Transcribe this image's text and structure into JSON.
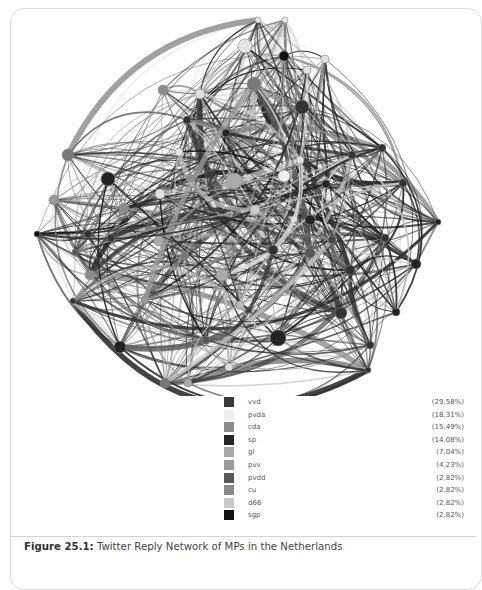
{
  "figure": {
    "label": "Figure 25.1:",
    "title": " Twitter Reply Network of MPs in the Netherlands"
  },
  "legend": [
    {
      "party": "vvd",
      "pct": "(29,58%)",
      "color": "#3a3a3a"
    },
    {
      "party": "pvda",
      "pct": "(18,31%)",
      "color": "#eeeeee"
    },
    {
      "party": "cda",
      "pct": "(15,49%)",
      "color": "#8c8c8c"
    },
    {
      "party": "sp",
      "pct": "(14,08%)",
      "color": "#262626"
    },
    {
      "party": "gl",
      "pct": "(7,04%)",
      "color": "#a8a8a8"
    },
    {
      "party": "pvv",
      "pct": "(4,23%)",
      "color": "#9a9a9a"
    },
    {
      "party": "pvdd",
      "pct": "(2,82%)",
      "color": "#5a5a5a"
    },
    {
      "party": "cu",
      "pct": "(2,82%)",
      "color": "#8a8a8a"
    },
    {
      "party": "d66",
      "pct": "(2,82%)",
      "color": "#c8c8c8"
    },
    {
      "party": "sgp",
      "pct": "(2,82%)",
      "color": "#111111"
    }
  ],
  "network": {
    "nodes": [
      {
        "x": 258,
        "y": 20,
        "r": 3,
        "c": "#e8e8e8"
      },
      {
        "x": 285,
        "y": 20,
        "r": 3,
        "c": "#e8e8e8"
      },
      {
        "x": 245,
        "y": 46,
        "r": 7,
        "c": "#e4e4e4"
      },
      {
        "x": 284,
        "y": 56,
        "r": 5,
        "c": "#111111"
      },
      {
        "x": 325,
        "y": 59,
        "r": 4,
        "c": "#e4e4e4"
      },
      {
        "x": 254,
        "y": 84,
        "r": 7,
        "c": "#7a7a7a"
      },
      {
        "x": 307,
        "y": 70,
        "r": 4,
        "c": "#e4e4e4"
      },
      {
        "x": 302,
        "y": 107,
        "r": 7,
        "c": "#333333"
      },
      {
        "x": 200,
        "y": 94,
        "r": 5,
        "c": "#dddddd"
      },
      {
        "x": 163,
        "y": 90,
        "r": 5,
        "c": "#8c8c8c"
      },
      {
        "x": 179,
        "y": 152,
        "r": 4,
        "c": "#e4e4e4"
      },
      {
        "x": 234,
        "y": 181,
        "r": 8,
        "c": "#aaaaaa"
      },
      {
        "x": 284,
        "y": 176,
        "r": 6,
        "c": "#eeeeee"
      },
      {
        "x": 187,
        "y": 120,
        "r": 4,
        "c": "#333333"
      },
      {
        "x": 226,
        "y": 133,
        "r": 4,
        "c": "#222222"
      },
      {
        "x": 68,
        "y": 155,
        "r": 6,
        "c": "#7a7a7a"
      },
      {
        "x": 108,
        "y": 179,
        "r": 7,
        "c": "#222222"
      },
      {
        "x": 54,
        "y": 200,
        "r": 5,
        "c": "#999999"
      },
      {
        "x": 124,
        "y": 208,
        "r": 5,
        "c": "#8c8c8c"
      },
      {
        "x": 160,
        "y": 194,
        "r": 5,
        "c": "#e0e0e0"
      },
      {
        "x": 190,
        "y": 178,
        "r": 4,
        "c": "#8c8c8c"
      },
      {
        "x": 37,
        "y": 234,
        "r": 3,
        "c": "#111111"
      },
      {
        "x": 88,
        "y": 234,
        "r": 4,
        "c": "#333333"
      },
      {
        "x": 111,
        "y": 238,
        "r": 4,
        "c": "#333333"
      },
      {
        "x": 75,
        "y": 252,
        "r": 3,
        "c": "#555555"
      },
      {
        "x": 90,
        "y": 275,
        "r": 5,
        "c": "#8c8c8c"
      },
      {
        "x": 73,
        "y": 301,
        "r": 3,
        "c": "#333333"
      },
      {
        "x": 159,
        "y": 241,
        "r": 5,
        "c": "#aaaaaa"
      },
      {
        "x": 185,
        "y": 255,
        "r": 4,
        "c": "#777777"
      },
      {
        "x": 222,
        "y": 275,
        "r": 6,
        "c": "#aaaaaa"
      },
      {
        "x": 120,
        "y": 347,
        "r": 6,
        "c": "#222222"
      },
      {
        "x": 165,
        "y": 383,
        "r": 5,
        "c": "#777777"
      },
      {
        "x": 188,
        "y": 383,
        "r": 4,
        "c": "#aaaaaa"
      },
      {
        "x": 229,
        "y": 367,
        "r": 4,
        "c": "#dddddd"
      },
      {
        "x": 278,
        "y": 338,
        "r": 8,
        "c": "#222222"
      },
      {
        "x": 341,
        "y": 313,
        "r": 6,
        "c": "#333333"
      },
      {
        "x": 385,
        "y": 238,
        "r": 4,
        "c": "#333333"
      },
      {
        "x": 403,
        "y": 183,
        "r": 4,
        "c": "#333333"
      },
      {
        "x": 438,
        "y": 222,
        "r": 3,
        "c": "#222222"
      },
      {
        "x": 416,
        "y": 264,
        "r": 5,
        "c": "#222222"
      },
      {
        "x": 396,
        "y": 312,
        "r": 4,
        "c": "#222222"
      },
      {
        "x": 370,
        "y": 345,
        "r": 4,
        "c": "#333333"
      },
      {
        "x": 350,
        "y": 270,
        "r": 5,
        "c": "#333333"
      },
      {
        "x": 310,
        "y": 220,
        "r": 5,
        "c": "#222222"
      },
      {
        "x": 352,
        "y": 155,
        "r": 4,
        "c": "#333333"
      },
      {
        "x": 382,
        "y": 148,
        "r": 4,
        "c": "#333333"
      },
      {
        "x": 310,
        "y": 253,
        "r": 5,
        "c": "#555555"
      },
      {
        "x": 273,
        "y": 250,
        "r": 5,
        "c": "#333333"
      },
      {
        "x": 326,
        "y": 184,
        "r": 4,
        "c": "#222222"
      },
      {
        "x": 332,
        "y": 240,
        "r": 4,
        "c": "#444444"
      },
      {
        "x": 368,
        "y": 370,
        "r": 3,
        "c": "#333333"
      },
      {
        "x": 300,
        "y": 160,
        "r": 4,
        "c": "#e0e0e0"
      },
      {
        "x": 206,
        "y": 340,
        "r": 4,
        "c": "#555555"
      },
      {
        "x": 145,
        "y": 300,
        "r": 4,
        "c": "#999999"
      },
      {
        "x": 240,
        "y": 305,
        "r": 4,
        "c": "#bbbbbb"
      },
      {
        "x": 255,
        "y": 210,
        "r": 5,
        "c": "#cccccc"
      }
    ]
  }
}
